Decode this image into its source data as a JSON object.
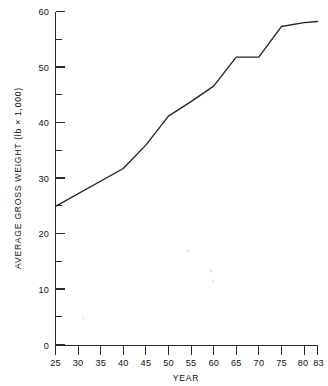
{
  "chart_data": {
    "type": "line",
    "title": "",
    "xlabel": "YEAR",
    "ylabel": "AVERAGE GROSS WEIGHT (lb × 1,000)",
    "xlim": [
      25,
      83
    ],
    "ylim": [
      0,
      60
    ],
    "grid": false,
    "legend": null,
    "x_tick_labels": [
      "25",
      "30",
      "35",
      "40",
      "45",
      "50",
      "55",
      "60",
      "65",
      "70",
      "75",
      "80",
      "83"
    ],
    "x_ticks": [
      25,
      30,
      35,
      40,
      45,
      50,
      55,
      60,
      65,
      70,
      75,
      80,
      83
    ],
    "y_tick_labels": [
      "0",
      "10",
      "20",
      "30",
      "40",
      "50",
      "60"
    ],
    "y_ticks": [
      0,
      10,
      20,
      30,
      40,
      50,
      60
    ],
    "y_minor_ticks": [
      5,
      15,
      25,
      35,
      45,
      55
    ],
    "series": [
      {
        "name": "Average gross weight",
        "x": [
          25,
          40,
          45,
          50,
          55,
          60,
          65,
          70,
          75,
          80,
          83
        ],
        "values": [
          25.0,
          31.8,
          36.0,
          41.2,
          43.8,
          46.6,
          51.8,
          51.8,
          57.3,
          58.0,
          58.2
        ]
      }
    ],
    "line_color": "#232323",
    "annotations": []
  },
  "figure": {
    "axis_color": "#2b2b2b",
    "background": "#ffffff"
  }
}
